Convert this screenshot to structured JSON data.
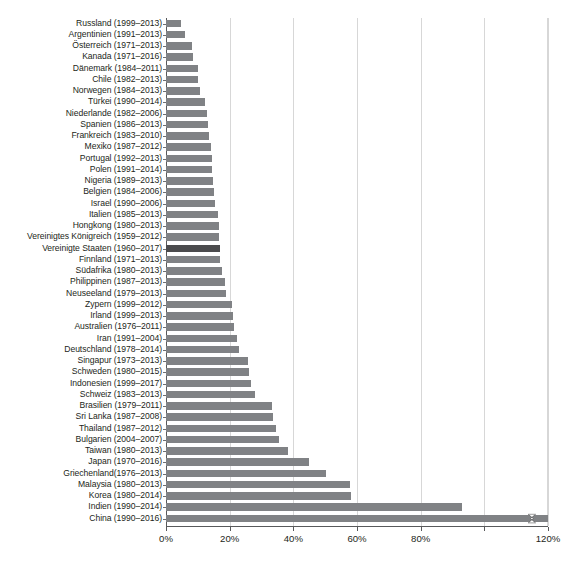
{
  "chart_data": {
    "type": "bar",
    "orientation": "horizontal",
    "title": "",
    "subtitle": "",
    "xlabel": "",
    "ylabel": "",
    "xlim": [
      0,
      120
    ],
    "grid": true,
    "legend_position": "none",
    "xtick_labels": [
      "0%",
      "20%",
      "40%",
      "60%",
      "80%",
      "120%"
    ],
    "xticks": [
      0,
      20,
      40,
      60,
      80,
      120
    ],
    "xtick_step": 20,
    "unit": "%",
    "highlight_category": "Vereinigte Staaten (1960–2017)",
    "colors": {
      "bar": "#808285",
      "bar_highlight": "#4b4b4d",
      "gridline": "#d7d7d7",
      "axis": "#58595b",
      "text": "#231f20",
      "background": "#ffffff"
    },
    "categories": [
      "Russland (1999–2013)",
      "Argentinien (1991–2013)",
      "Österreich (1971–2013)",
      "Kanada (1971–2016)",
      "Dänemark (1984–2011)",
      "Chile (1982–2013)",
      "Norwegen (1984–2013)",
      "Türkei (1990–2014)",
      "Niederlande (1982–2006)",
      "Spanien (1986–2013)",
      "Frankreich (1983–2010)",
      "Mexiko (1987–2012)",
      "Portugal (1992–2013)",
      "Polen (1991–2014)",
      "Nigeria (1989–2013)",
      "Belgien (1984–2006)",
      "Israel (1990–2006)",
      "Italien (1985–2013)",
      "Hongkong (1980–2013)",
      "Vereinigtes Königreich (1959–2012)",
      "Vereinigte Staaten (1960–2017)",
      "Finnland (1971–2013)",
      "Südafrika (1980–2013)",
      "Philippinen (1987–2013)",
      "Neuseeland (1979–2013)",
      "Zypern (1999–2012)",
      "Irland (1999–2013)",
      "Australien (1976–2011)",
      "Iran (1991–2004)",
      "Deutschland (1978–2014)",
      "Singapur (1973–2013)",
      "Schweden (1980–2015)",
      "Indonesien (1999–2017)",
      "Schweiz (1983–2013)",
      "Brasilien (1979–2011)",
      "Sri Lanka (1987–2008)",
      "Thailand (1987–2012)",
      "Bulgarien (2004–2007)",
      "Taiwan (1980–2013)",
      "Japan (1970–2016)",
      "Griechenland(1976–2013)",
      "Malaysia (1980–2013)",
      "Korea (1980–2014)",
      "Indien (1990–2014)",
      "China (1990–2016)"
    ],
    "values": [
      4.7,
      6.0,
      8.3,
      8.6,
      10.0,
      10.1,
      10.8,
      12.2,
      13.0,
      13.2,
      13.4,
      14.0,
      14.3,
      14.6,
      14.9,
      15.2,
      15.5,
      16.3,
      16.5,
      16.7,
      17.0,
      17.1,
      17.6,
      18.4,
      18.8,
      20.6,
      21.2,
      21.5,
      22.3,
      23.0,
      25.8,
      26.0,
      26.6,
      27.9,
      33.4,
      33.7,
      34.5,
      35.6,
      38.3,
      45.0,
      50.4,
      57.8,
      58.0,
      93.0,
      120.0
    ],
    "truncated": [
      false,
      false,
      false,
      false,
      false,
      false,
      false,
      false,
      false,
      false,
      false,
      false,
      false,
      false,
      false,
      false,
      false,
      false,
      false,
      false,
      false,
      false,
      false,
      false,
      false,
      false,
      false,
      false,
      false,
      false,
      false,
      false,
      false,
      false,
      false,
      false,
      false,
      false,
      false,
      false,
      false,
      false,
      false,
      false,
      true
    ]
  }
}
